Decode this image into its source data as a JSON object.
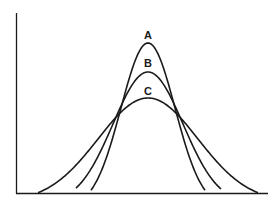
{
  "chart_data": {
    "type": "line",
    "title": "",
    "xlabel": "",
    "ylabel": "",
    "grid": false,
    "legend": "none",
    "series": [
      {
        "name": "A",
        "center": 148,
        "peak_height": 0.82,
        "spread": "narrow",
        "label_pos": [
          148,
          39
        ]
      },
      {
        "name": "B",
        "center": 148,
        "peak_height": 0.66,
        "spread": "medium",
        "label_pos": [
          148,
          67
        ]
      },
      {
        "name": "C",
        "center": 148,
        "peak_height": 0.52,
        "spread": "wide",
        "label_pos": [
          148,
          95
        ]
      }
    ],
    "annotations": [
      "A",
      "B",
      "C"
    ]
  },
  "colors": {
    "line": "#1a1a1a",
    "background": "#ffffff"
  }
}
